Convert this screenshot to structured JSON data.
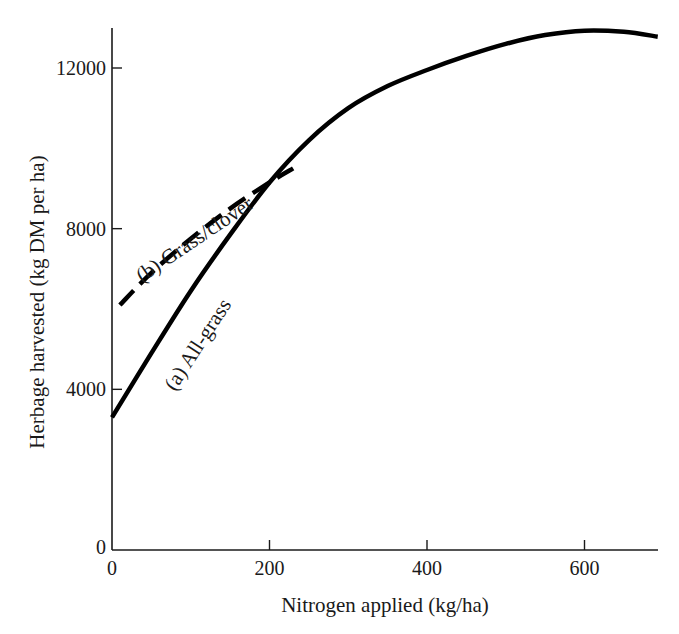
{
  "chart_data": {
    "type": "line",
    "title": "",
    "xlabel": "Nitrogen applied (kg/ha)",
    "ylabel": "Herbage harvested (kg DM per ha)",
    "xlim": [
      0,
      700
    ],
    "ylim": [
      0,
      13000
    ],
    "x_ticks": [
      0,
      200,
      400,
      600
    ],
    "x_tick_labels": [
      "0",
      "200",
      "400",
      "600"
    ],
    "y_ticks": [
      0,
      4000,
      8000,
      12000
    ],
    "y_tick_labels": [
      "0",
      "4000",
      "8000",
      "12000"
    ],
    "grid": false,
    "legend": "inline labels along curves",
    "series": [
      {
        "name": "(a) All-grass",
        "style": "solid",
        "x": [
          0,
          50,
          100,
          150,
          200,
          250,
          300,
          350,
          400,
          450,
          500,
          550,
          600,
          650,
          693
        ],
        "values": [
          3300,
          4900,
          6450,
          7850,
          9150,
          10200,
          11000,
          11550,
          11950,
          12300,
          12600,
          12820,
          12930,
          12900,
          12780
        ]
      },
      {
        "name": "(b) Grass/clover",
        "style": "dashed",
        "x": [
          10,
          50,
          100,
          150,
          200,
          230
        ],
        "values": [
          6100,
          6900,
          7750,
          8500,
          9150,
          9500
        ]
      }
    ]
  },
  "colors": {
    "line": "#000000",
    "axis": "#1a1a1a",
    "background": "#ffffff"
  }
}
